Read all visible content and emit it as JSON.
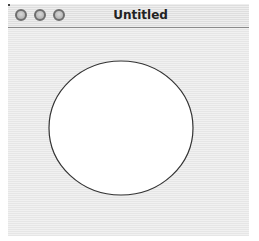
{
  "window": {
    "title": "Untitled",
    "buttons": [
      {
        "name": "close",
        "icon": "circle-button-icon"
      },
      {
        "name": "minimize",
        "icon": "circle-button-icon"
      },
      {
        "name": "zoom",
        "icon": "circle-button-icon"
      }
    ]
  },
  "canvas": {
    "shape": "ellipse",
    "ellipse": {
      "cx": 121,
      "cy": 128,
      "rx": 72,
      "ry": 67,
      "fill": "#ffffff",
      "stroke": "#333333"
    }
  }
}
